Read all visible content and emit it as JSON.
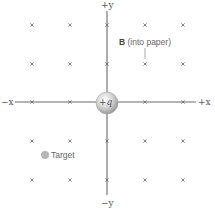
{
  "diagram": {
    "title": "",
    "axes": {
      "pos_y_label": "+y",
      "neg_y_label": "−y",
      "pos_x_label": "+x",
      "neg_x_label": "−x",
      "color": "#555555"
    },
    "field": {
      "label_bold": "B",
      "label_rest": "(into paper)",
      "symbol": "×",
      "direction": "into paper",
      "grid_columns": [
        32,
        70,
        107,
        145,
        183
      ],
      "grid_rows": [
        25,
        64,
        102,
        141,
        180
      ],
      "color": "#666666"
    },
    "charge": {
      "label": "+q",
      "color": "#c8c8c8"
    },
    "target": {
      "label": "Target",
      "color": "#b0b0b0"
    }
  }
}
